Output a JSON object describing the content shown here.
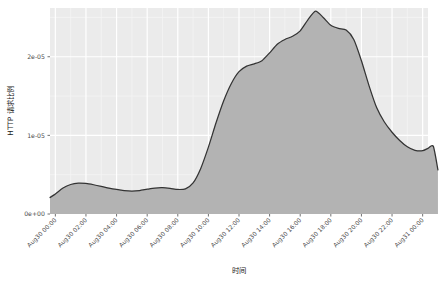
{
  "chart_data": {
    "type": "area",
    "title": "",
    "subtitle": "",
    "xlabel": "时间",
    "ylabel": "HTTP 请求比例",
    "grid": true,
    "legend": false,
    "legend_position": "none",
    "theme": {
      "panel_background": "#ebebeb",
      "grid_major_color": "#ffffff",
      "grid_minor_color": "#f5f5f5",
      "area_fill": "#b3b3b3",
      "line_color": "#333333",
      "axis_text_color": "#4d4d4d",
      "axis_title_color": "#1a1a1a",
      "plot_background": "#ffffff"
    },
    "ylim": [
      0,
      2.62e-05
    ],
    "ytick_values": [
      0,
      1e-05,
      2e-05
    ],
    "ytick_labels": [
      "0e+00",
      "1e-05",
      "2e-05"
    ],
    "xtick_labels": [
      "Aug30 00:00",
      "Aug30 02:00",
      "Aug30 04:00",
      "Aug30 06:00",
      "Aug30 08:00",
      "Aug30 10:00",
      "Aug30 12:00",
      "Aug30 14:00",
      "Aug30 16:00",
      "Aug30 18:00",
      "Aug30 20:00",
      "Aug30 22:00",
      "Aug31 00:00"
    ],
    "xtick_hours": [
      0,
      2,
      4,
      6,
      8,
      10,
      12,
      14,
      16,
      18,
      20,
      22,
      24
    ],
    "xlim_hours": [
      -0.35,
      24.35
    ],
    "series": [
      {
        "name": "HTTP 请求比例",
        "x_hours": [
          -0.35,
          0.0,
          0.5,
          1.0,
          1.5,
          2.0,
          2.5,
          3.0,
          3.5,
          4.0,
          4.5,
          5.0,
          5.5,
          6.0,
          6.5,
          7.0,
          7.5,
          8.0,
          8.5,
          9.0,
          9.5,
          10.0,
          10.5,
          11.0,
          11.5,
          12.0,
          12.5,
          13.0,
          13.5,
          14.0,
          14.5,
          15.0,
          15.5,
          16.0,
          16.5,
          17.0,
          17.5,
          18.0,
          18.5,
          19.0,
          19.5,
          20.0,
          20.5,
          21.0,
          21.5,
          22.0,
          22.5,
          23.0,
          23.5,
          24.0,
          24.35
        ],
        "values": [
          2.1e-06,
          2.55e-06,
          3.3e-06,
          3.75e-06,
          3.92e-06,
          3.88e-06,
          3.72e-06,
          3.52e-06,
          3.3e-06,
          3.12e-06,
          2.98e-06,
          2.92e-06,
          2.98e-06,
          3.15e-06,
          3.3e-06,
          3.34e-06,
          3.26e-06,
          3.12e-06,
          3.2e-06,
          3.95e-06,
          5.8e-06,
          8.5e-06,
          1.16e-05,
          1.44e-05,
          1.66e-05,
          1.81e-05,
          1.88e-05,
          1.91e-05,
          1.95e-05,
          2.05e-05,
          2.16e-05,
          2.22e-05,
          2.26e-05,
          2.33e-05,
          2.47e-05,
          2.58e-05,
          2.5e-05,
          2.4e-05,
          2.36e-05,
          2.34e-05,
          2.22e-05,
          1.95e-05,
          1.63e-05,
          1.35e-05,
          1.17e-05,
          1.04e-05,
          9.35e-06,
          8.55e-06,
          8.1e-06,
          8.05e-06,
          8.35e-06
        ],
        "tail_x_hours": [
          24.35,
          24.7,
          25.0
        ],
        "tail_values": [
          8.35e-06,
          8.6e-06,
          5.6e-06
        ]
      }
    ],
    "peak": {
      "x_hour": 17.0,
      "value": 2.58e-05
    },
    "minimum": {
      "x_hour": 5.0,
      "value": 2.92e-06
    }
  }
}
